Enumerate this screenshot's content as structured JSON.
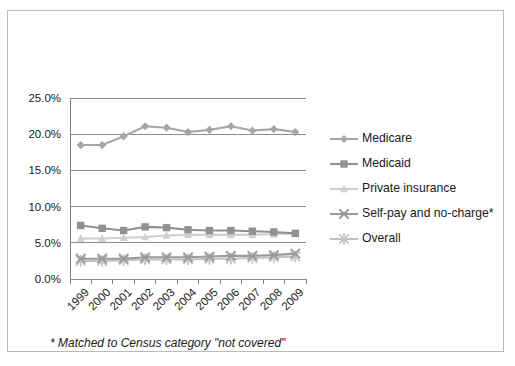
{
  "figure": {
    "footnote": "* Matched to Census category \"not covered\"",
    "border_color": "#b9b9b9",
    "background": "#ffffff"
  },
  "legend": {
    "position": "right",
    "items": [
      {
        "label": "Medicare",
        "marker": "diamond-marker",
        "color": "#a6a6a6"
      },
      {
        "label": "Medicaid",
        "marker": "square-marker",
        "color": "#919191"
      },
      {
        "label": "Private insurance",
        "marker": "triangle-marker",
        "color": "#cfcfcf"
      },
      {
        "label": "Self-pay and no-charge*",
        "marker": "x-marker",
        "color": "#9a9a9a"
      },
      {
        "label": "Overall",
        "marker": "asterisk-marker",
        "color": "#c2c2c2"
      }
    ]
  },
  "chart_data": {
    "type": "line",
    "title": "",
    "subtitle": "",
    "xlabel": "",
    "ylabel": "",
    "grid": true,
    "legend_position": "right",
    "ylim": [
      0,
      25
    ],
    "ytick_labels": [
      "0.0%",
      "5.0%",
      "10.0%",
      "15.0%",
      "20.0%",
      "25.0%"
    ],
    "ytick_values": [
      0,
      5,
      10,
      15,
      20,
      25
    ],
    "categories": [
      "1999",
      "2000",
      "2001",
      "2002",
      "2003",
      "2004",
      "2005",
      "2006",
      "2007",
      "2008",
      "2009"
    ],
    "series": [
      {
        "name": "Medicare",
        "marker": "diamond-marker",
        "color": "#a6a6a6",
        "values": [
          18.5,
          18.5,
          19.7,
          21.1,
          20.9,
          20.3,
          20.6,
          21.1,
          20.5,
          20.7,
          20.3
        ]
      },
      {
        "name": "Medicaid",
        "marker": "square-marker",
        "color": "#919191",
        "values": [
          7.4,
          7.0,
          6.7,
          7.2,
          7.1,
          6.8,
          6.7,
          6.7,
          6.6,
          6.5,
          6.3
        ]
      },
      {
        "name": "Private insurance",
        "marker": "triangle-marker",
        "color": "#cfcfcf",
        "values": [
          5.6,
          5.6,
          5.7,
          5.8,
          6.0,
          6.1,
          6.1,
          6.1,
          6.1,
          6.2,
          6.3
        ]
      },
      {
        "name": "Self-pay and no-charge*",
        "marker": "x-marker",
        "color": "#9a9a9a",
        "values": [
          2.8,
          2.8,
          2.8,
          3.0,
          3.0,
          3.0,
          3.1,
          3.2,
          3.2,
          3.3,
          3.5
        ]
      },
      {
        "name": "Overall",
        "marker": "asterisk-marker",
        "color": "#c2c2c2",
        "values": [
          2.5,
          2.5,
          2.6,
          2.7,
          2.7,
          2.7,
          2.8,
          2.8,
          2.9,
          3.0,
          3.1
        ]
      }
    ]
  }
}
